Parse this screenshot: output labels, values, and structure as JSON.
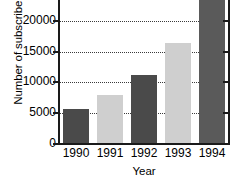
{
  "chart_data": {
    "type": "bar",
    "title": "",
    "xlabel": "Year",
    "ylabel": "Number of subscribers",
    "categories": [
      "1990",
      "1991",
      "1992",
      "1993",
      "1994"
    ],
    "values": [
      5700,
      8000,
      11200,
      16400,
      24200
    ],
    "bar_colors": [
      "#4a4a4a",
      "#cfcfcf",
      "#4a4a4a",
      "#cfcfcf",
      "#5a5a5a"
    ],
    "ylim": [
      0,
      23400
    ],
    "yticks": [
      0,
      5000,
      10000,
      15000,
      20000
    ],
    "ytick_labels": [
      "0",
      "5000",
      "10000",
      "15000",
      "20000"
    ],
    "grid": true,
    "grid_color": "#3a3a3a",
    "legend": null
  },
  "axis": {
    "line_color": "#1a1a1a"
  }
}
